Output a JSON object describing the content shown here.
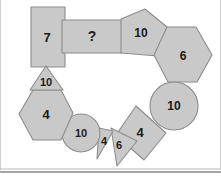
{
  "figure": {
    "background_color": "#ffffff",
    "shape_fill_color": "#c9c9c9",
    "shape_stroke_color": "#8c8c8c",
    "label_color": "#1a1a1a",
    "divider_color": "#4a4a4a",
    "width": 221,
    "height": 181
  },
  "shapes": [
    {
      "id": "rectangle-7",
      "kind": "rectangle",
      "label": "7",
      "points": "31,7 65,7 65,67 31,67",
      "label_x": 47,
      "label_y": 37,
      "font_size": 13
    },
    {
      "id": "rectangle-question",
      "kind": "rectangle",
      "label": "?",
      "points": "62,20 122,20 122,53 62,53",
      "label_x": 92,
      "label_y": 36,
      "font_size": 14
    },
    {
      "id": "pentagon-10",
      "kind": "pentagon",
      "label": "10",
      "points": "121,19 145,9 167,27 158,56 121,53",
      "label_x": 141,
      "label_y": 33,
      "font_size": 12
    },
    {
      "id": "hexagon-6",
      "kind": "hexagon",
      "label": "6",
      "points": "167,27 196,27 212,55 197,82 168,82 154,55",
      "label_x": 183,
      "label_y": 56,
      "font_size": 12
    },
    {
      "id": "circle-10-right",
      "kind": "circle",
      "label": "10",
      "cx": 174,
      "cy": 106,
      "r": 24,
      "label_x": 174,
      "label_y": 106,
      "font_size": 12
    },
    {
      "id": "square-4",
      "kind": "square",
      "label": "4",
      "points": "136,106 166,133 144,160 116,135",
      "label_x": 140,
      "label_y": 132,
      "font_size": 13
    },
    {
      "id": "triangle-6",
      "kind": "triangle",
      "label": "6",
      "points": "111,128 137,141 117,166",
      "label_x": 119,
      "label_y": 145,
      "font_size": 11
    },
    {
      "id": "triangle-4",
      "kind": "triangle",
      "label": "4",
      "points": "99,128 113,131 97,159",
      "label_x": 104,
      "label_y": 141,
      "font_size": 11
    },
    {
      "id": "circle-10-bottom",
      "kind": "circle",
      "label": "10",
      "cx": 81,
      "cy": 133,
      "r": 19,
      "label_x": 81,
      "label_y": 133,
      "font_size": 11
    },
    {
      "id": "hexagon-4",
      "kind": "hexagon",
      "label": "4",
      "points": "33,90 61,90 73,113 61,140 33,140 19,114",
      "label_x": 46,
      "label_y": 114,
      "font_size": 13
    },
    {
      "id": "triangle-10",
      "kind": "triangle",
      "label": "10",
      "points": "46,66 63,90 30,90",
      "label_x": 46,
      "label_y": 82,
      "font_size": 11
    }
  ],
  "divider": {
    "name": "bottom-divider",
    "y": 172,
    "x1": 0,
    "x2": 221
  }
}
